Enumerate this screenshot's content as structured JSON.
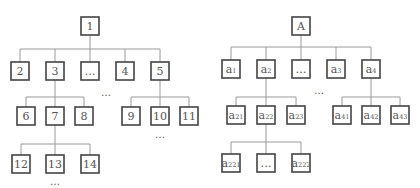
{
  "diagram": {
    "type": "tree-diagrams",
    "colors": {
      "box_border": "#444444",
      "edge": "#9a9a9a",
      "text": "#555555",
      "background": "#ffffff"
    },
    "left_tree": {
      "root": "1",
      "level1": [
        "2",
        "3",
        "…",
        "4",
        "5"
      ],
      "children_of_3": [
        "6",
        "7",
        "8"
      ],
      "children_of_5": [
        "9",
        "10",
        "11"
      ],
      "children_of_7": [
        "12",
        "13",
        "14"
      ],
      "ellipses": [
        "…",
        "…",
        "…"
      ]
    },
    "right_tree": {
      "root": "A",
      "level1": [
        {
          "base": "a",
          "sub": "1"
        },
        {
          "base": "a",
          "sub": "2"
        },
        {
          "base": "…",
          "sub": ""
        },
        {
          "base": "a",
          "sub": "3"
        },
        {
          "base": "a",
          "sub": "4"
        }
      ],
      "children_of_a2": [
        {
          "base": "a",
          "sub": "21"
        },
        {
          "base": "a",
          "sub": "22"
        },
        {
          "base": "a",
          "sub": "23"
        }
      ],
      "children_of_a4": [
        {
          "base": "a",
          "sub": "41"
        },
        {
          "base": "a",
          "sub": "42"
        },
        {
          "base": "a",
          "sub": "43"
        }
      ],
      "children_of_a22": [
        {
          "base": "a",
          "sub": "221"
        },
        {
          "base": "…",
          "sub": ""
        },
        {
          "base": "a",
          "sub": "222"
        }
      ],
      "ellipses": [
        "…"
      ]
    }
  }
}
